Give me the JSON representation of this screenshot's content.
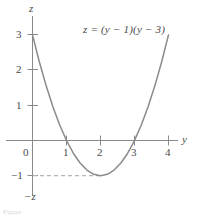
{
  "figure": {
    "equation_label": "z = (y − 1)(y − 3)",
    "axis_labels": {
      "vertical_top": "z",
      "vertical_bottom": "−z",
      "horizontal_right": "y"
    },
    "y_tick_labels": [
      "3",
      "2",
      "1",
      "−1"
    ],
    "x_tick_labels": [
      "0",
      "1",
      "2",
      "3",
      "4"
    ],
    "guide_line_label": "−1",
    "caption_fragment": "Figure"
  },
  "colors": {
    "curve": "#8a8a8a",
    "axis": "#8a8a8a",
    "text": "#4a4a4a",
    "guide": "#b5b5b5",
    "background": "#ffffff"
  },
  "chart_data": {
    "type": "line",
    "title": "",
    "subtitle": "",
    "xlabel": "y",
    "ylabel": "z",
    "equation": "z = (y - 1)(y - 3)",
    "grid": false,
    "legend": null,
    "xlim": [
      -0.45,
      4.6
    ],
    "ylim": [
      -1.6,
      3.9
    ],
    "xticks": [
      0,
      1,
      2,
      3,
      4
    ],
    "yticks": [
      -1,
      1,
      2,
      3
    ],
    "annotations": [
      {
        "text": "z = (y − 1)(y − 3)",
        "x": 2.5,
        "y": 3.0
      },
      {
        "text": "dashed guide at z = −1 from y = 0 to vertex y = 2",
        "x": 1.0,
        "y": -1.0
      }
    ],
    "roots": [
      1,
      3
    ],
    "vertex": {
      "x": 2,
      "y": -1
    },
    "y_intercept": 3,
    "series": [
      {
        "name": "z = (y-1)(y-3)",
        "x": [
          -0.35,
          -0.2,
          0.0,
          0.2,
          0.4,
          0.6,
          0.8,
          1.0,
          1.2,
          1.4,
          1.6,
          1.8,
          2.0,
          2.2,
          2.4,
          2.6,
          2.8,
          3.0,
          3.2,
          3.4,
          3.6,
          3.8,
          4.0,
          4.2,
          4.35
        ],
        "y": [
          4.52,
          3.84,
          3.0,
          2.24,
          1.56,
          0.96,
          0.44,
          0.0,
          -0.36,
          -0.64,
          -0.84,
          -0.96,
          -1.0,
          -0.96,
          -0.84,
          -0.64,
          -0.36,
          0.0,
          0.44,
          0.96,
          1.56,
          2.24,
          3.0,
          3.84,
          4.52
        ]
      }
    ]
  }
}
